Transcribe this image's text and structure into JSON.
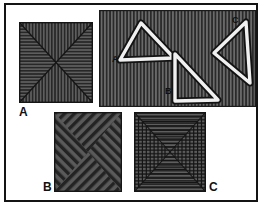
{
  "figure": {
    "title": "",
    "background_color": "#ffffff",
    "frame_color": "#141414",
    "stripe_dark": "#2b2b2b",
    "stripe_light": "#575757",
    "fill_gray": "#4a4a4a",
    "outline_white": "#efefef",
    "outline_black": "#111111"
  },
  "panels": [
    {
      "id": "panel-a-square",
      "label": "A",
      "label_color": "#111111",
      "description": "square divided by two diagonals into four triangles; top and bottom triangles vertically striped, left and right triangles horizontally striped",
      "x": 17,
      "y": 20,
      "width": 74,
      "height": 81
    },
    {
      "id": "panel-triangles",
      "label": "",
      "description": "vertically striped rectangle containing three outlined triangles labelled A, B and C",
      "x": 97,
      "y": 8,
      "width": 157,
      "height": 97,
      "shapes": [
        {
          "id": "triangle-a",
          "label": "A",
          "orientation": "apex-up",
          "label_x": 110,
          "label_y": 58
        },
        {
          "id": "triangle-b",
          "label": "B",
          "orientation": "right-angle-bottom-left",
          "label_x": 163,
          "label_y": 90
        },
        {
          "id": "triangle-c",
          "label": "C",
          "orientation": "apex-left",
          "label_x": 230,
          "label_y": 18
        }
      ]
    },
    {
      "id": "panel-b-square",
      "label": "B",
      "label_color": "#111111",
      "description": "square divided by two diagonals into four triangles filled with diagonal hatching alternating in direction, pinwheel effect",
      "x": 52,
      "y": 110,
      "width": 68,
      "height": 80
    },
    {
      "id": "panel-c-square",
      "label": "C",
      "label_color": "#111111",
      "description": "square of nested concentric squares joined by corner diagonals, horizontally striped, giving a tunnel effect",
      "x": 132,
      "y": 110,
      "width": 72,
      "height": 80
    }
  ],
  "labels": [
    {
      "name": "label-panel-a",
      "text": "A",
      "x": 17,
      "y": 104
    },
    {
      "name": "label-panel-b",
      "text": "B",
      "x": 41,
      "y": 179
    },
    {
      "name": "label-panel-c",
      "text": "C",
      "x": 207,
      "y": 179
    },
    {
      "name": "label-triangle-a",
      "text": "A",
      "x": 109,
      "y": 52
    },
    {
      "name": "label-triangle-b",
      "text": "B",
      "x": 162,
      "y": 84
    },
    {
      "name": "label-triangle-c",
      "text": "C",
      "x": 229,
      "y": 13
    }
  ]
}
